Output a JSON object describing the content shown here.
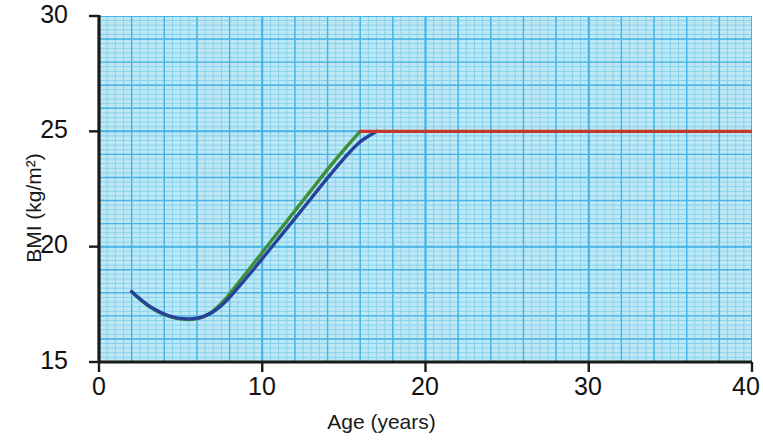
{
  "chart_data": {
    "type": "line",
    "title": "",
    "xlabel": "Age (years)",
    "ylabel": "BMI (kg/m²)",
    "xlim": [
      0,
      40
    ],
    "ylim": [
      15,
      30
    ],
    "xticks": [
      "0",
      "10",
      "20",
      "30",
      "40"
    ],
    "xtick_values": [
      0,
      10,
      20,
      30,
      40
    ],
    "yticks": [
      "15",
      "20",
      "25",
      "30"
    ],
    "ytick_values": [
      15,
      20,
      25,
      30
    ],
    "grid": true,
    "grid_major_x_step": 2,
    "grid_major_y_step": 1,
    "grid_minor_x_step": 0.5,
    "grid_minor_y_step": 0.2,
    "legend": "inline-labels",
    "annotations": [
      {
        "name": "who-title",
        "text": "Overweight BMI according to WHO",
        "x": 21.5,
        "y": 28.0
      },
      {
        "name": "men-and-women",
        "text": "Men and women",
        "x": 23.0,
        "y": 26.7
      }
    ],
    "series": [
      {
        "name": "Girls",
        "label": "Girls",
        "color": "#3f8f3a",
        "points": [
          {
            "x": 2.0,
            "y": 18.05
          },
          {
            "x": 2.5,
            "y": 17.72
          },
          {
            "x": 3.0,
            "y": 17.44
          },
          {
            "x": 3.5,
            "y": 17.22
          },
          {
            "x": 4.0,
            "y": 17.05
          },
          {
            "x": 4.5,
            "y": 16.93
          },
          {
            "x": 5.0,
            "y": 16.86
          },
          {
            "x": 5.5,
            "y": 16.84
          },
          {
            "x": 6.0,
            "y": 16.88
          },
          {
            "x": 6.5,
            "y": 17.0
          },
          {
            "x": 7.0,
            "y": 17.22
          },
          {
            "x": 7.5,
            "y": 17.55
          },
          {
            "x": 8.0,
            "y": 17.95
          },
          {
            "x": 9.0,
            "y": 18.85
          },
          {
            "x": 10.0,
            "y": 19.75
          },
          {
            "x": 11.0,
            "y": 20.65
          },
          {
            "x": 12.0,
            "y": 21.55
          },
          {
            "x": 13.0,
            "y": 22.45
          },
          {
            "x": 14.0,
            "y": 23.35
          },
          {
            "x": 15.0,
            "y": 24.2
          },
          {
            "x": 16.0,
            "y": 25.0
          }
        ]
      },
      {
        "name": "Boys",
        "label": "Boys",
        "color": "#27429b",
        "points": [
          {
            "x": 2.0,
            "y": 18.05
          },
          {
            "x": 2.5,
            "y": 17.74
          },
          {
            "x": 3.0,
            "y": 17.47
          },
          {
            "x": 3.5,
            "y": 17.25
          },
          {
            "x": 4.0,
            "y": 17.08
          },
          {
            "x": 4.5,
            "y": 16.96
          },
          {
            "x": 5.0,
            "y": 16.89
          },
          {
            "x": 5.5,
            "y": 16.87
          },
          {
            "x": 6.0,
            "y": 16.9
          },
          {
            "x": 6.5,
            "y": 17.0
          },
          {
            "x": 7.0,
            "y": 17.18
          },
          {
            "x": 7.5,
            "y": 17.45
          },
          {
            "x": 8.0,
            "y": 17.8
          },
          {
            "x": 9.0,
            "y": 18.62
          },
          {
            "x": 10.0,
            "y": 19.48
          },
          {
            "x": 11.0,
            "y": 20.35
          },
          {
            "x": 12.0,
            "y": 21.22
          },
          {
            "x": 13.0,
            "y": 22.1
          },
          {
            "x": 14.0,
            "y": 22.98
          },
          {
            "x": 15.0,
            "y": 23.82
          },
          {
            "x": 16.0,
            "y": 24.55
          },
          {
            "x": 17.0,
            "y": 25.0
          }
        ]
      },
      {
        "name": "Men and women",
        "label": "Men and women",
        "color": "#c0392b",
        "points": [
          {
            "x": 16.0,
            "y": 25.0
          },
          {
            "x": 40.0,
            "y": 25.0
          }
        ]
      }
    ]
  },
  "colors": {
    "plot_background": "#bfe8f5",
    "grid_major": "#47b3e6",
    "grid_minor": "#86d2ef",
    "axis": "#1a1a1a",
    "girls": "#3f8f3a",
    "boys": "#27429b",
    "adult_threshold": "#c0392b",
    "text": "#111111"
  }
}
